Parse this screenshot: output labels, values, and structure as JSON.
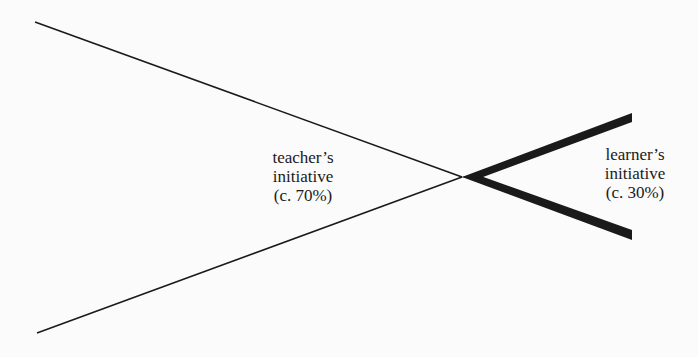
{
  "diagram": {
    "teacher_label": {
      "line1": "teacher’s",
      "line2": "initiative",
      "line3": "(c. 70%)"
    },
    "learner_label": {
      "line1": "learner’s",
      "line2": "initiative",
      "line3": "(c. 30%)"
    },
    "colors": {
      "line": "#1a1a1a",
      "background": "#fbfbfb"
    }
  }
}
